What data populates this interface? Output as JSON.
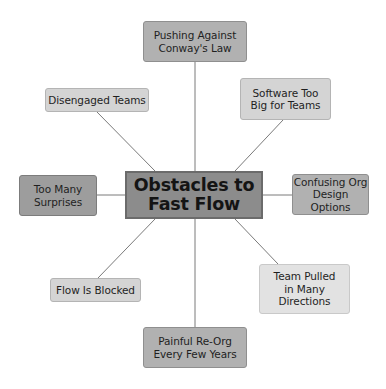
{
  "diagram": {
    "type": "mind-map",
    "center": {
      "label": "Obstacles to\nFast Flow",
      "fill": "#8c8c8c"
    },
    "nodes": [
      {
        "id": "conways-law",
        "label": "Pushing Against\nConway's Law",
        "position": "top",
        "fill": "#b1b1b1"
      },
      {
        "id": "disengaged-teams",
        "label": "Disengaged Teams",
        "position": "upper-left",
        "fill": "#d4d4d4"
      },
      {
        "id": "software-too-big",
        "label": "Software Too\nBig for Teams",
        "position": "upper-right",
        "fill": "#d4d4d4"
      },
      {
        "id": "too-many-surprises",
        "label": "Too Many\nSurprises",
        "position": "left",
        "fill": "#9d9d9d"
      },
      {
        "id": "confusing-org-design",
        "label": "Confusing Org\nDesign Options",
        "position": "right",
        "fill": "#b1b1b1"
      },
      {
        "id": "flow-is-blocked",
        "label": "Flow Is Blocked",
        "position": "lower-left",
        "fill": "#d4d4d4"
      },
      {
        "id": "team-pulled",
        "label": "Team Pulled\nin Many\nDirections",
        "position": "lower-right",
        "fill": "#e2e2e2"
      },
      {
        "id": "painful-reorg",
        "label": "Painful Re-Org\nEvery Few Years",
        "position": "bottom",
        "fill": "#b1b1b1"
      }
    ],
    "edges": [
      {
        "from": "center",
        "to": "conways-law"
      },
      {
        "from": "center",
        "to": "disengaged-teams"
      },
      {
        "from": "center",
        "to": "software-too-big"
      },
      {
        "from": "center",
        "to": "too-many-surprises"
      },
      {
        "from": "center",
        "to": "confusing-org-design"
      },
      {
        "from": "center",
        "to": "flow-is-blocked"
      },
      {
        "from": "center",
        "to": "team-pulled"
      },
      {
        "from": "center",
        "to": "painful-reorg"
      }
    ],
    "line_color": "#7a7a7a"
  }
}
